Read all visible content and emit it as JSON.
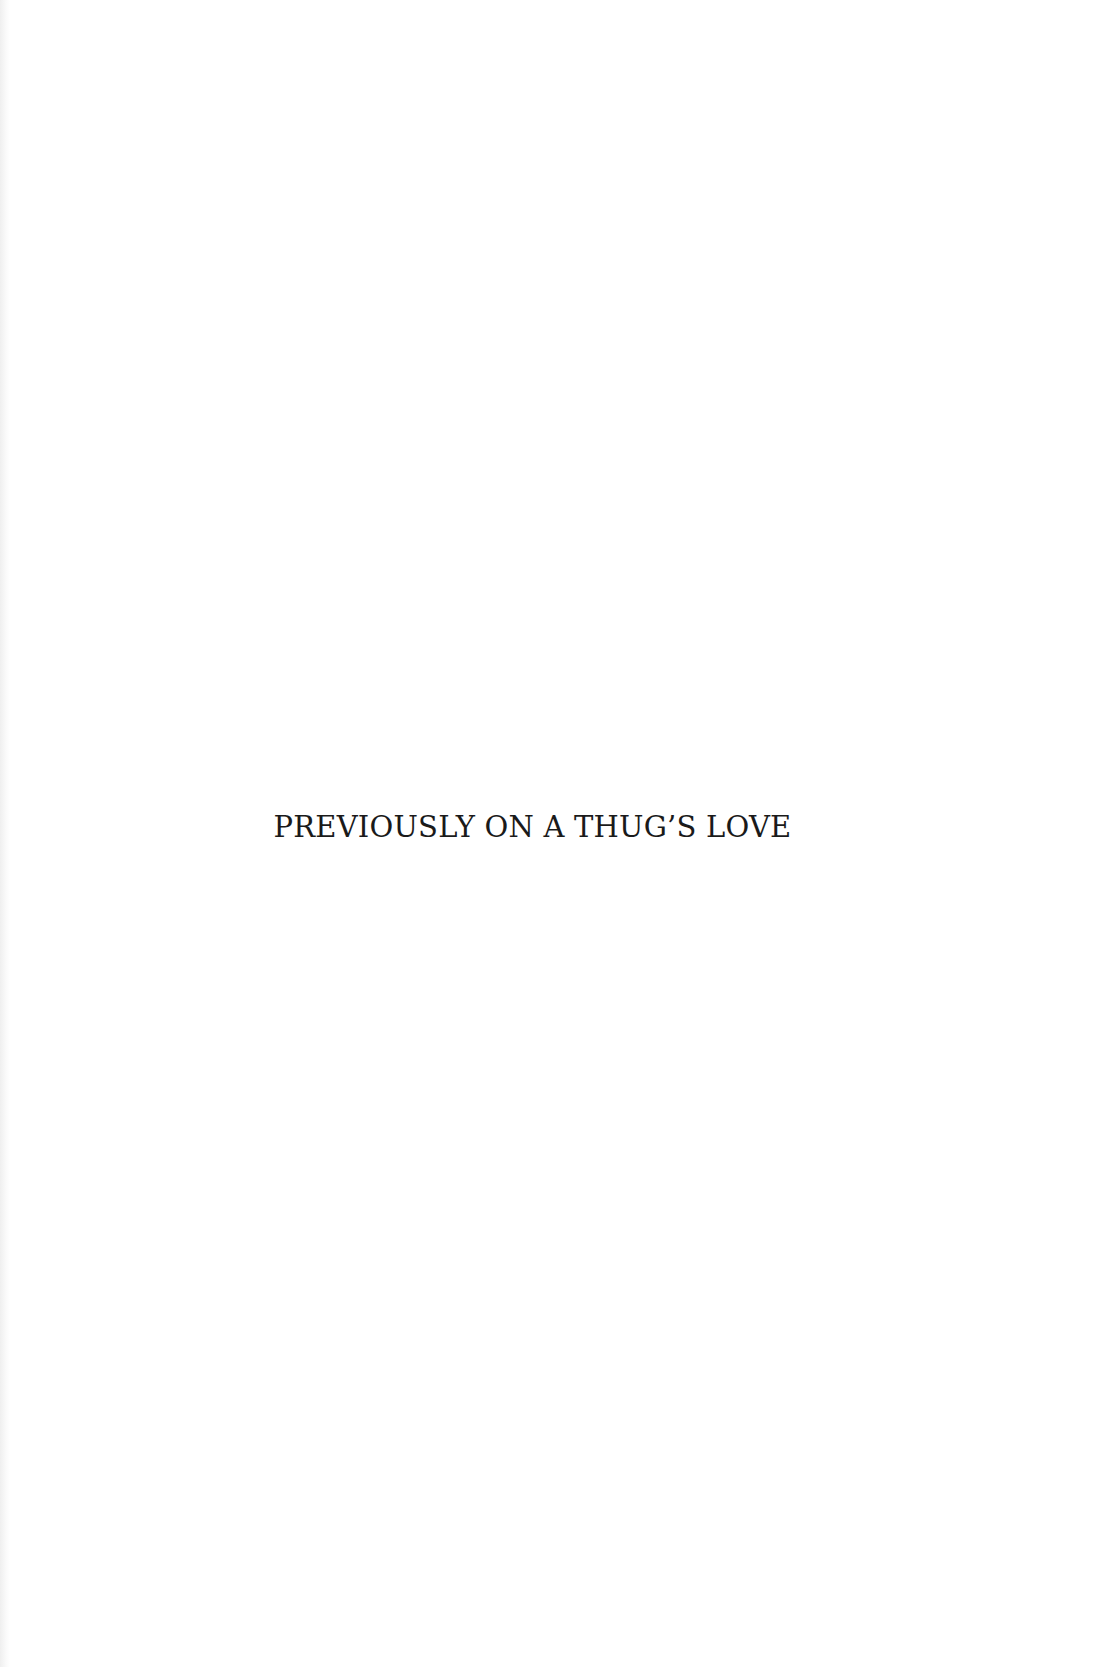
{
  "page": {
    "title": "PREVIOUSLY ON A THUG’S LOVE"
  }
}
